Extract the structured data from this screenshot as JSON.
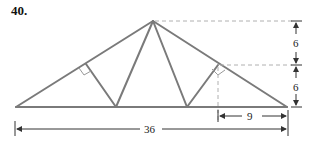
{
  "problem": {
    "number": "40."
  },
  "diagram": {
    "type": "roof-truss",
    "member_color": "#7a7a7a",
    "dim_color": "#333333",
    "guide_color": "#b0b0b0",
    "dimensions": {
      "span": "36",
      "right_offset": "9",
      "upper_height": "6",
      "lower_height": "6"
    }
  }
}
